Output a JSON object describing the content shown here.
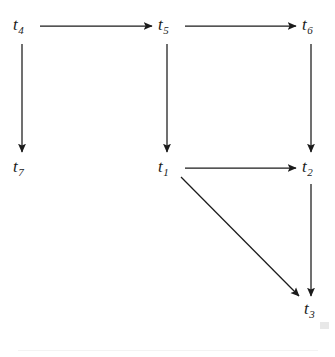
{
  "figure": {
    "kind": "directed-graph",
    "background_color": "#ffffff",
    "ink_color": "#1b1b1b",
    "width": 335,
    "height": 357
  },
  "nodes": [
    {
      "id": "t4",
      "base": "t",
      "subscript": "4",
      "label": "t4",
      "x": 22,
      "y": 27
    },
    {
      "id": "t5",
      "base": "t",
      "subscript": "5",
      "label": "t5",
      "x": 167,
      "y": 27
    },
    {
      "id": "t6",
      "base": "t",
      "subscript": "6",
      "label": "t6",
      "x": 311,
      "y": 27
    },
    {
      "id": "t7",
      "base": "t",
      "subscript": "7",
      "label": "t7",
      "x": 22,
      "y": 169
    },
    {
      "id": "t1",
      "base": "t",
      "subscript": "1",
      "label": "t1",
      "x": 167,
      "y": 169
    },
    {
      "id": "t2",
      "base": "t",
      "subscript": "2",
      "label": "t2",
      "x": 311,
      "y": 169
    },
    {
      "id": "t3",
      "base": "t",
      "subscript": "3",
      "label": "t3",
      "x": 313,
      "y": 311
    }
  ],
  "edges": [
    {
      "id": "e-t4-t5",
      "from": "t4",
      "to": "t5",
      "orientation": "horizontal",
      "x1": 40,
      "y1": 26,
      "x2": 152,
      "y2": 26
    },
    {
      "id": "e-t5-t6",
      "from": "t5",
      "to": "t6",
      "orientation": "horizontal",
      "x1": 185,
      "y1": 26,
      "x2": 296,
      "y2": 26
    },
    {
      "id": "e-t4-t7",
      "from": "t4",
      "to": "t7",
      "orientation": "vertical",
      "x1": 22,
      "y1": 44,
      "x2": 22,
      "y2": 152
    },
    {
      "id": "e-t5-t1",
      "from": "t5",
      "to": "t1",
      "orientation": "vertical",
      "x1": 167,
      "y1": 44,
      "x2": 167,
      "y2": 152
    },
    {
      "id": "e-t6-t2",
      "from": "t6",
      "to": "t2",
      "orientation": "vertical",
      "x1": 311,
      "y1": 44,
      "x2": 311,
      "y2": 152
    },
    {
      "id": "e-t1-t2",
      "from": "t1",
      "to": "t2",
      "orientation": "horizontal",
      "x1": 185,
      "y1": 168,
      "x2": 296,
      "y2": 168
    },
    {
      "id": "e-t2-t3",
      "from": "t2",
      "to": "t3",
      "orientation": "vertical",
      "x1": 311,
      "y1": 184,
      "x2": 311,
      "y2": 296
    },
    {
      "id": "e-t1-t3",
      "from": "t1",
      "to": "t3",
      "orientation": "diagonal",
      "x1": 181,
      "y1": 177,
      "x2": 299,
      "y2": 296
    }
  ],
  "artifacts": {
    "bottom_rule": "faint-horizontal-scan-line",
    "corner_mark": "faint-corner-speck"
  }
}
